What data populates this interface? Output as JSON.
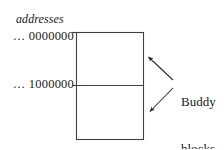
{
  "figure": {
    "background_color": "#ffffff",
    "line_color": "#404040",
    "text_color": "#1a1a1a"
  },
  "axis_heading": {
    "label": "addresses",
    "style": "italic"
  },
  "address_labels": [
    {
      "id": "top",
      "label": "… 0000000",
      "marks": "top edge of upper block"
    },
    {
      "id": "middle",
      "label": "… 1000000",
      "marks": "boundary between the two buddy blocks"
    }
  ],
  "memory_block": {
    "outline": "rectangle",
    "divider": "horizontal line at midpoint",
    "regions": [
      {
        "id": "upper-block",
        "label": ""
      },
      {
        "id": "lower-block",
        "label": ""
      }
    ]
  },
  "annotation": {
    "line1": "Buddy",
    "line2": "blocks",
    "arrows": [
      {
        "id": "upper-arrow",
        "points_to": "upper-block",
        "direction": "up-left"
      },
      {
        "id": "lower-arrow",
        "points_to": "lower-block",
        "direction": "down-left"
      }
    ]
  }
}
